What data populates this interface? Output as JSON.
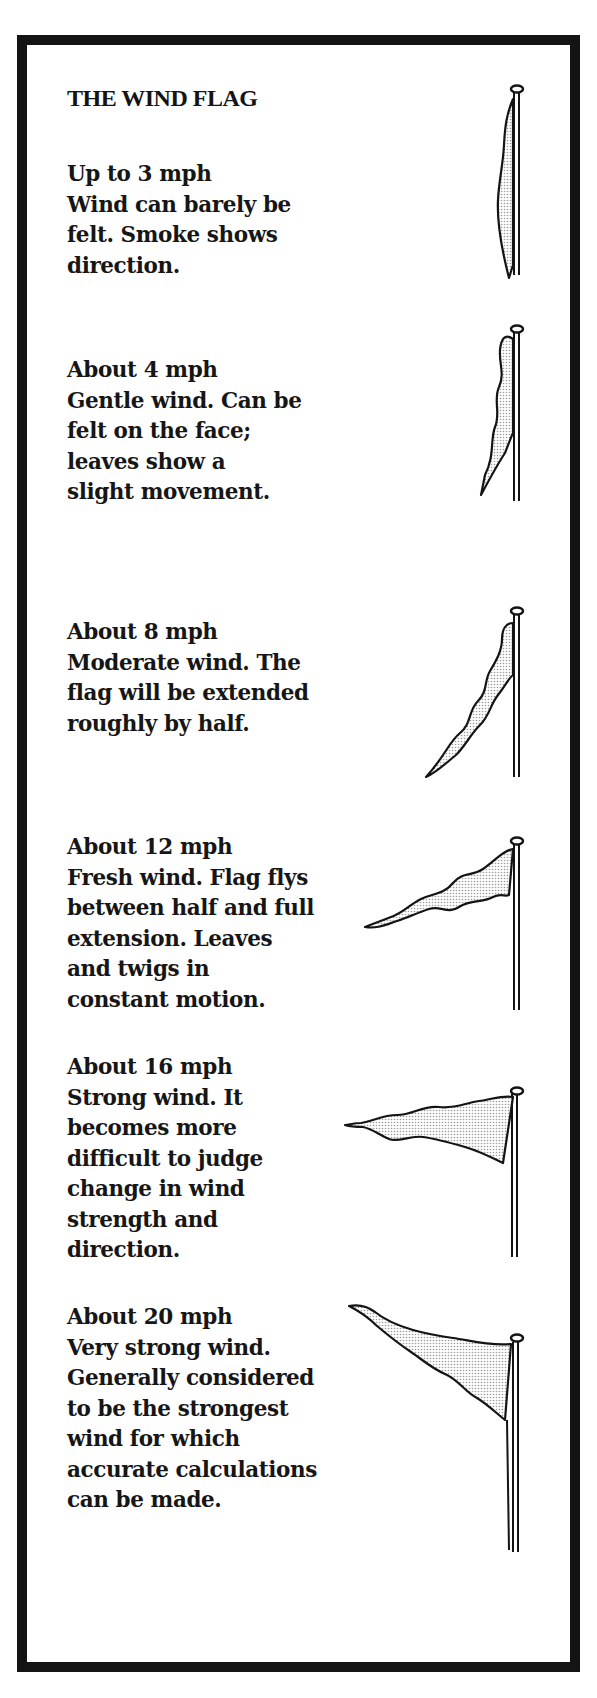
{
  "title": "THE WIND FLAG",
  "colors": {
    "ink": "#141414",
    "paper": "#ffffff",
    "flag_fill": "#d8d8d8"
  },
  "entries": [
    {
      "speed": "Up to 3 mph",
      "lines": [
        "Wind can barely be",
        "felt. Smoke shows",
        "direction."
      ],
      "icon": "limp-flag-icon"
    },
    {
      "speed": "About 4 mph",
      "lines": [
        "Gentle wind. Can be",
        "felt on the face;",
        "leaves show a",
        "slight movement."
      ],
      "icon": "slightly-lifted-flag-icon"
    },
    {
      "speed": "About 8 mph",
      "lines": [
        "Moderate wind. The",
        "flag will be extended",
        "roughly by half."
      ],
      "icon": "half-extended-flag-icon"
    },
    {
      "speed": "About 12 mph",
      "lines": [
        "Fresh wind. Flag flys",
        "between half and full",
        "extension. Leaves",
        "and twigs in",
        "constant motion."
      ],
      "icon": "mostly-extended-flag-icon"
    },
    {
      "speed": "About 16 mph",
      "lines": [
        "Strong wind. It",
        "becomes more",
        "difficult to judge",
        "change in wind",
        "strength and",
        "direction."
      ],
      "icon": "fully-extended-flag-icon"
    },
    {
      "speed": "About 20 mph",
      "lines": [
        "Very strong wind.",
        "Generally considered",
        "to be the strongest",
        "wind for which",
        "accurate calculations",
        "can be made."
      ],
      "icon": "raised-flag-icon"
    }
  ]
}
